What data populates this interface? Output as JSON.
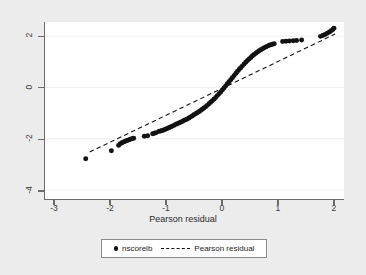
{
  "chart": {
    "type": "scatter",
    "title": "",
    "xlabel": "Pearson residual",
    "ylabel": "",
    "xlim": [
      -3.18,
      2.18
    ],
    "ylim": [
      -4.35,
      2.55
    ],
    "xticks": [
      -3,
      -2,
      -1,
      0,
      1,
      2
    ],
    "xtick_labels": [
      "-3",
      "-2",
      "-1",
      "0",
      "1",
      "2"
    ],
    "yticks": [
      2,
      0,
      -2,
      -4
    ],
    "ytick_labels": [
      "2",
      "0",
      "-2",
      "-4"
    ],
    "grid": "horizontal",
    "grid_color": "#f1f1f1",
    "background": "#ffffff",
    "frame_color": "#6b6b6b",
    "marker_color": "#121212",
    "reference_line_color": "#121212",
    "reference_line_style": "dashed",
    "reference_line": {
      "x0": -2.38,
      "y0": -2.52,
      "x1": 2.02,
      "y1": 2.08
    },
    "legend": {
      "position": "below",
      "entries": [
        {
          "label": "nscorelb",
          "marker": "dot",
          "icon": "legend-dot-icon"
        },
        {
          "label": "Pearson residual",
          "marker": "dashed-line",
          "icon": "legend-dash-icon"
        }
      ]
    },
    "series": [
      {
        "name": "nscorelb",
        "marker": "dot",
        "points": [
          [
            -2.45,
            -2.78
          ],
          [
            -1.99,
            -2.47
          ],
          [
            -1.86,
            -2.26
          ],
          [
            -1.83,
            -2.2
          ],
          [
            -1.8,
            -2.16
          ],
          [
            -1.77,
            -2.13
          ],
          [
            -1.74,
            -2.1
          ],
          [
            -1.71,
            -2.07
          ],
          [
            -1.68,
            -2.05
          ],
          [
            -1.65,
            -2.02
          ],
          [
            -1.62,
            -2.0
          ],
          [
            -1.59,
            -1.98
          ],
          [
            -1.4,
            -1.9
          ],
          [
            -1.34,
            -1.88
          ],
          [
            -1.25,
            -1.81
          ],
          [
            -1.22,
            -1.79
          ],
          [
            -1.19,
            -1.77
          ],
          [
            -1.14,
            -1.72
          ],
          [
            -1.11,
            -1.7
          ],
          [
            -1.08,
            -1.68
          ],
          [
            -1.05,
            -1.66
          ],
          [
            -1.02,
            -1.63
          ],
          [
            -0.99,
            -1.6
          ],
          [
            -0.96,
            -1.57
          ],
          [
            -0.93,
            -1.54
          ],
          [
            -0.9,
            -1.51
          ],
          [
            -0.87,
            -1.48
          ],
          [
            -0.84,
            -1.45
          ],
          [
            -0.81,
            -1.42
          ],
          [
            -0.78,
            -1.39
          ],
          [
            -0.75,
            -1.36
          ],
          [
            -0.72,
            -1.33
          ],
          [
            -0.69,
            -1.29
          ],
          [
            -0.66,
            -1.26
          ],
          [
            -0.63,
            -1.23
          ],
          [
            -0.6,
            -1.19
          ],
          [
            -0.57,
            -1.15
          ],
          [
            -0.54,
            -1.11
          ],
          [
            -0.51,
            -1.07
          ],
          [
            -0.48,
            -1.03
          ],
          [
            -0.45,
            -0.99
          ],
          [
            -0.42,
            -0.95
          ],
          [
            -0.39,
            -0.9
          ],
          [
            -0.36,
            -0.85
          ],
          [
            -0.33,
            -0.8
          ],
          [
            -0.3,
            -0.75
          ],
          [
            -0.27,
            -0.7
          ],
          [
            -0.24,
            -0.64
          ],
          [
            -0.21,
            -0.58
          ],
          [
            -0.18,
            -0.52
          ],
          [
            -0.15,
            -0.46
          ],
          [
            -0.12,
            -0.39
          ],
          [
            -0.09,
            -0.32
          ],
          [
            -0.06,
            -0.25
          ],
          [
            -0.03,
            -0.18
          ],
          [
            0.0,
            -0.1
          ],
          [
            0.03,
            -0.02
          ],
          [
            0.06,
            0.06
          ],
          [
            0.09,
            0.14
          ],
          [
            0.12,
            0.22
          ],
          [
            0.15,
            0.3
          ],
          [
            0.18,
            0.38
          ],
          [
            0.21,
            0.46
          ],
          [
            0.24,
            0.54
          ],
          [
            0.27,
            0.62
          ],
          [
            0.3,
            0.7
          ],
          [
            0.33,
            0.77
          ],
          [
            0.36,
            0.84
          ],
          [
            0.39,
            0.91
          ],
          [
            0.42,
            0.98
          ],
          [
            0.45,
            1.05
          ],
          [
            0.48,
            1.11
          ],
          [
            0.51,
            1.17
          ],
          [
            0.54,
            1.23
          ],
          [
            0.57,
            1.28
          ],
          [
            0.6,
            1.33
          ],
          [
            0.63,
            1.38
          ],
          [
            0.66,
            1.43
          ],
          [
            0.69,
            1.47
          ],
          [
            0.72,
            1.51
          ],
          [
            0.75,
            1.55
          ],
          [
            0.78,
            1.58
          ],
          [
            0.81,
            1.61
          ],
          [
            0.84,
            1.64
          ],
          [
            0.87,
            1.66
          ],
          [
            0.9,
            1.68
          ],
          [
            0.93,
            1.7
          ],
          [
            1.08,
            1.79
          ],
          [
            1.14,
            1.8
          ],
          [
            1.2,
            1.81
          ],
          [
            1.27,
            1.82
          ],
          [
            1.33,
            1.83
          ],
          [
            1.42,
            1.85
          ],
          [
            1.76,
            1.99
          ],
          [
            1.8,
            2.02
          ],
          [
            1.84,
            2.06
          ],
          [
            1.88,
            2.11
          ],
          [
            1.92,
            2.16
          ],
          [
            1.95,
            2.21
          ],
          [
            1.98,
            2.26
          ],
          [
            2.0,
            2.31
          ]
        ]
      }
    ]
  }
}
